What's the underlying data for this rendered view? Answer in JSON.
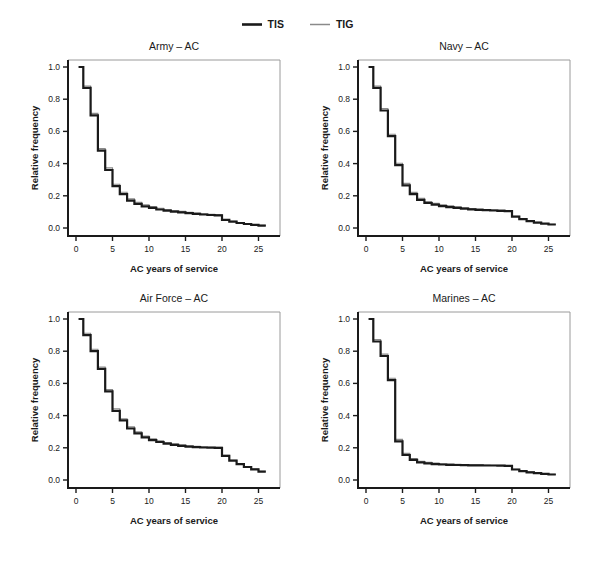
{
  "figure": {
    "background": "#ffffff",
    "text_color": "#1a1a1a",
    "frame_color": "#9a9a9a"
  },
  "legend": {
    "items": [
      {
        "label": "TIS",
        "color": "#1a1a1a",
        "stroke_width": 2.2
      },
      {
        "label": "TIG",
        "color": "#8a8a8a",
        "stroke_width": 1.1
      }
    ]
  },
  "chart_data": [
    {
      "type": "line",
      "subtype": "step-survival",
      "title": "Army – AC",
      "xlabel": "AC years of service",
      "ylabel": "Relative frequency",
      "xlim": [
        0,
        26
      ],
      "ylim": [
        0,
        1.0
      ],
      "x_ticks": [
        0,
        5,
        10,
        15,
        20,
        25
      ],
      "y_ticks": [
        0.0,
        0.2,
        0.4,
        0.6,
        0.8,
        1.0
      ],
      "grid": false,
      "legend_position": "top-center-shared",
      "step_note": "values[i] = relative frequency held over AC years [i, i+1)",
      "years": [
        0,
        1,
        2,
        3,
        4,
        5,
        6,
        7,
        8,
        9,
        10,
        11,
        12,
        13,
        14,
        15,
        16,
        17,
        18,
        19,
        20,
        21,
        22,
        23,
        24,
        25
      ],
      "series": [
        {
          "name": "TIS",
          "values": [
            1.0,
            0.87,
            0.7,
            0.48,
            0.36,
            0.26,
            0.21,
            0.17,
            0.15,
            0.135,
            0.125,
            0.115,
            0.108,
            0.102,
            0.097,
            0.092,
            0.088,
            0.084,
            0.081,
            0.079,
            0.05,
            0.04,
            0.031,
            0.025,
            0.02,
            0.015
          ]
        },
        {
          "name": "TIG",
          "values": [
            1.0,
            0.882,
            0.712,
            0.493,
            0.373,
            0.272,
            0.222,
            0.181,
            0.16,
            0.144,
            0.133,
            0.123,
            0.115,
            0.109,
            0.103,
            0.098,
            0.093,
            0.089,
            0.086,
            0.083,
            0.053,
            0.042,
            0.033,
            0.027,
            0.022,
            0.016
          ]
        }
      ]
    },
    {
      "type": "line",
      "subtype": "step-survival",
      "title": "Navy – AC",
      "xlabel": "AC years of service",
      "ylabel": "Relative frequency",
      "xlim": [
        0,
        26
      ],
      "ylim": [
        0,
        1.0
      ],
      "x_ticks": [
        0,
        5,
        10,
        15,
        20,
        25
      ],
      "y_ticks": [
        0.0,
        0.2,
        0.4,
        0.6,
        0.8,
        1.0
      ],
      "grid": false,
      "legend_position": "top-center-shared",
      "step_note": "values[i] = relative frequency held over AC years [i, i+1)",
      "years": [
        0,
        1,
        2,
        3,
        4,
        5,
        6,
        7,
        8,
        9,
        10,
        11,
        12,
        13,
        14,
        15,
        16,
        17,
        18,
        19,
        20,
        21,
        22,
        23,
        24,
        25
      ],
      "series": [
        {
          "name": "TIS",
          "values": [
            1.0,
            0.87,
            0.73,
            0.57,
            0.39,
            0.265,
            0.21,
            0.175,
            0.155,
            0.145,
            0.136,
            0.13,
            0.125,
            0.12,
            0.116,
            0.113,
            0.111,
            0.109,
            0.107,
            0.105,
            0.07,
            0.055,
            0.042,
            0.033,
            0.027,
            0.022
          ]
        },
        {
          "name": "TIG",
          "values": [
            1.0,
            0.882,
            0.742,
            0.582,
            0.402,
            0.277,
            0.221,
            0.185,
            0.164,
            0.153,
            0.144,
            0.137,
            0.131,
            0.126,
            0.121,
            0.118,
            0.115,
            0.113,
            0.111,
            0.108,
            0.073,
            0.057,
            0.044,
            0.035,
            0.028,
            0.023
          ]
        }
      ]
    },
    {
      "type": "line",
      "subtype": "step-survival",
      "title": "Air Force – AC",
      "xlabel": "AC years of service",
      "ylabel": "Relative frequency",
      "xlim": [
        0,
        26
      ],
      "ylim": [
        0,
        1.0
      ],
      "x_ticks": [
        0,
        5,
        10,
        15,
        20,
        25
      ],
      "y_ticks": [
        0.0,
        0.2,
        0.4,
        0.6,
        0.8,
        1.0
      ],
      "grid": false,
      "legend_position": "top-center-shared",
      "step_note": "values[i] = relative frequency held over AC years [i, i+1)",
      "years": [
        0,
        1,
        2,
        3,
        4,
        5,
        6,
        7,
        8,
        9,
        10,
        11,
        12,
        13,
        14,
        15,
        16,
        17,
        18,
        19,
        20,
        21,
        22,
        23,
        24,
        25
      ],
      "series": [
        {
          "name": "TIS",
          "values": [
            1.0,
            0.9,
            0.8,
            0.69,
            0.55,
            0.43,
            0.37,
            0.32,
            0.29,
            0.265,
            0.248,
            0.236,
            0.226,
            0.218,
            0.212,
            0.207,
            0.204,
            0.202,
            0.201,
            0.2,
            0.15,
            0.12,
            0.099,
            0.081,
            0.066,
            0.052
          ]
        },
        {
          "name": "TIG",
          "values": [
            1.0,
            0.912,
            0.812,
            0.702,
            0.562,
            0.442,
            0.381,
            0.33,
            0.299,
            0.273,
            0.256,
            0.243,
            0.233,
            0.224,
            0.218,
            0.212,
            0.209,
            0.206,
            0.204,
            0.203,
            0.153,
            0.123,
            0.102,
            0.084,
            0.068,
            0.054
          ]
        }
      ]
    },
    {
      "type": "line",
      "subtype": "step-survival",
      "title": "Marines – AC",
      "xlabel": "AC years of service",
      "ylabel": "Relative frequency",
      "xlim": [
        0,
        26
      ],
      "ylim": [
        0,
        1.0
      ],
      "x_ticks": [
        0,
        5,
        10,
        15,
        20,
        25
      ],
      "y_ticks": [
        0.0,
        0.2,
        0.4,
        0.6,
        0.8,
        1.0
      ],
      "grid": false,
      "legend_position": "top-center-shared",
      "step_note": "values[i] = relative frequency held over AC years [i, i+1)",
      "years": [
        0,
        1,
        2,
        3,
        4,
        5,
        6,
        7,
        8,
        9,
        10,
        11,
        12,
        13,
        14,
        15,
        16,
        17,
        18,
        19,
        20,
        21,
        22,
        23,
        24,
        25
      ],
      "series": [
        {
          "name": "TIS",
          "values": [
            1.0,
            0.86,
            0.77,
            0.62,
            0.24,
            0.155,
            0.125,
            0.11,
            0.103,
            0.099,
            0.096,
            0.094,
            0.093,
            0.092,
            0.091,
            0.091,
            0.09,
            0.09,
            0.089,
            0.088,
            0.065,
            0.055,
            0.048,
            0.042,
            0.038,
            0.034
          ]
        },
        {
          "name": "TIG",
          "values": [
            1.0,
            0.872,
            0.782,
            0.632,
            0.252,
            0.165,
            0.133,
            0.117,
            0.11,
            0.105,
            0.101,
            0.099,
            0.097,
            0.096,
            0.095,
            0.094,
            0.093,
            0.092,
            0.091,
            0.09,
            0.067,
            0.057,
            0.05,
            0.044,
            0.039,
            0.035
          ]
        }
      ]
    }
  ]
}
